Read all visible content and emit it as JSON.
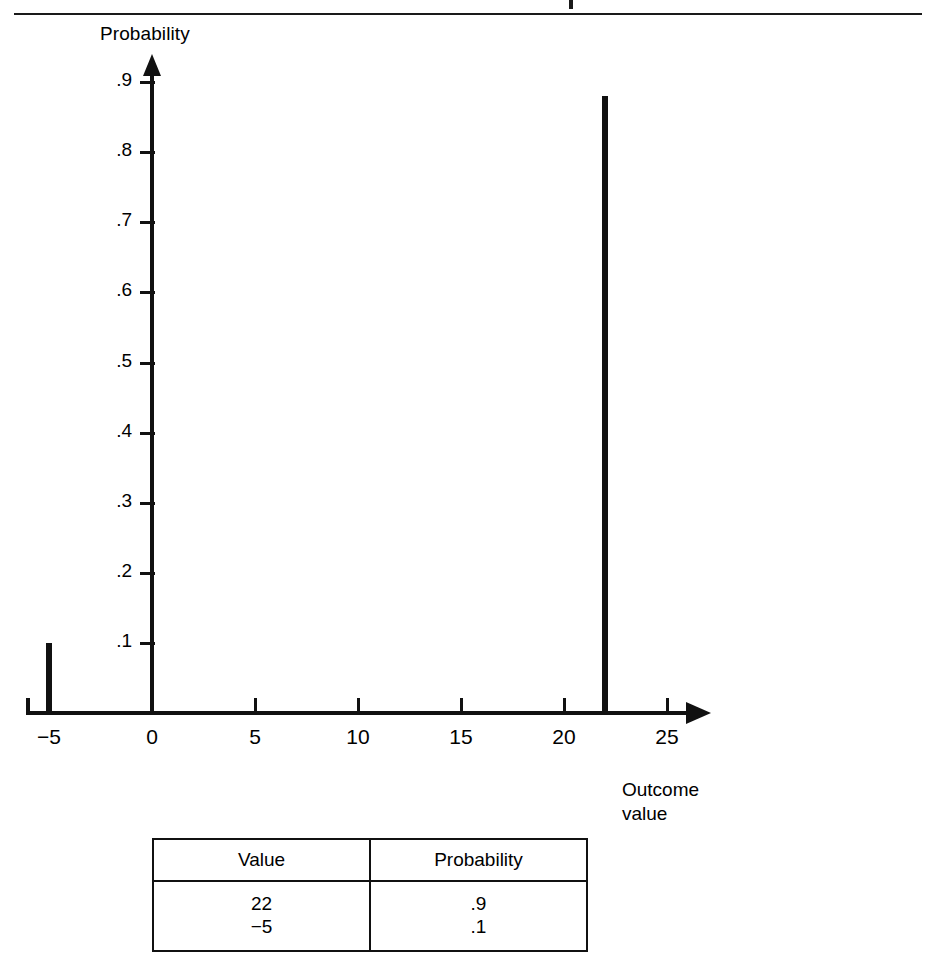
{
  "figure": {
    "top_rule": true,
    "y_axis_title": "Probability",
    "x_axis_title": "Outcome\nvalue",
    "y_ticks": [
      {
        "label": ".9",
        "value": 0.9
      },
      {
        "label": ".8",
        "value": 0.8
      },
      {
        "label": ".7",
        "value": 0.7
      },
      {
        "label": ".6",
        "value": 0.6
      },
      {
        "label": ".5",
        "value": 0.5
      },
      {
        "label": ".4",
        "value": 0.4
      },
      {
        "label": ".3",
        "value": 0.3
      },
      {
        "label": ".2",
        "value": 0.2
      },
      {
        "label": ".1",
        "value": 0.1
      }
    ],
    "x_ticks": [
      {
        "label": "−5",
        "value": -5
      },
      {
        "label": "0",
        "value": 0
      },
      {
        "label": "5",
        "value": 5
      },
      {
        "label": "10",
        "value": 10
      },
      {
        "label": "15",
        "value": 15
      },
      {
        "label": "20",
        "value": 20
      },
      {
        "label": "25",
        "value": 25
      }
    ]
  },
  "chart_data": {
    "type": "bar",
    "title": "",
    "subtitle": "",
    "xlabel": "Outcome value",
    "ylabel": "Probability",
    "x": [
      -5,
      22
    ],
    "values": [
      0.1,
      0.88
    ],
    "categories": [
      "-5",
      "22"
    ],
    "xlim": [
      -5,
      25
    ],
    "ylim": [
      0,
      0.9
    ],
    "xticks": [
      -5,
      0,
      5,
      10,
      15,
      20,
      25
    ],
    "yticks": [
      0.1,
      0.2,
      0.3,
      0.4,
      0.5,
      0.6,
      0.7,
      0.8,
      0.9
    ],
    "grid": false,
    "legend": false,
    "bar_color": "#111111",
    "annotations": []
  },
  "table": {
    "headers": [
      "Value",
      "Probability"
    ],
    "rows": [
      {
        "value": "22",
        "probability": ".9"
      },
      {
        "value": "−5",
        "probability": ".1"
      }
    ],
    "value_column_text": "22\n−5",
    "probability_column_text": ".9\n.1"
  },
  "colors": {
    "ink": "#111111",
    "background": "#ffffff",
    "rule": "#1a1a1a"
  }
}
